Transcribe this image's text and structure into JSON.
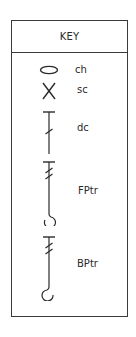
{
  "key": {
    "title": "KEY",
    "items": [
      {
        "symbol": "ellipse-icon",
        "label": "ch"
      },
      {
        "symbol": "x-cross-icon",
        "label": "sc"
      },
      {
        "symbol": "t-bar-single-slash-icon",
        "label": "dc"
      },
      {
        "symbol": "t-bar-double-slash-forward-hook-icon",
        "label": "FPtr"
      },
      {
        "symbol": "t-bar-double-slash-backward-hook-icon",
        "label": "BPtr"
      }
    ]
  },
  "colors": {
    "stroke": "#2a2a2a",
    "border": "#3a3a3a",
    "background": "#ffffff"
  }
}
